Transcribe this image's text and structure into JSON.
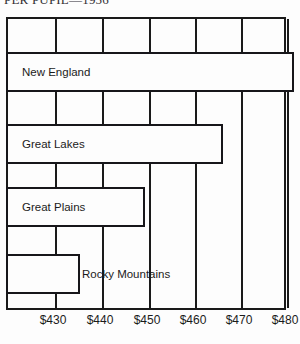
{
  "chart_data": {
    "type": "bar",
    "orientation": "horizontal",
    "title": "PER PUPIL—1956",
    "xlabel": "",
    "ylabel": "",
    "categories": [
      "New England",
      "Great Lakes",
      "Great Plains",
      "Rocky Mountains"
    ],
    "values": [
      480,
      465,
      448,
      434
    ],
    "value_labels": [
      "$480",
      "$465",
      "$448",
      "$434"
    ],
    "xlim": [
      420,
      480
    ],
    "xticks": [
      430,
      440,
      450,
      460,
      470,
      480
    ],
    "xtick_labels": [
      "$430",
      "$440",
      "$450",
      "$460",
      "$470",
      "$480"
    ],
    "grid": true,
    "grid_axis": "x",
    "legend": null,
    "bar_fill": "#fdfdfd",
    "bar_stroke": "#17161a",
    "frame_stroke": "#1a1a1a",
    "label_placement": [
      "inside",
      "inside",
      "inside",
      "outside"
    ],
    "series": [
      {
        "name": "Expenditure per pupil",
        "values": [
          480,
          465,
          448,
          434
        ]
      }
    ]
  },
  "bars": [
    {
      "label": "New England",
      "value": 480,
      "end_px": 286,
      "top_px": 33,
      "label_left_px": 14,
      "label_inside": true
    },
    {
      "label": "Great Lakes",
      "value": 465,
      "end_px": 215,
      "top_px": 105,
      "label_left_px": 14,
      "label_inside": true
    },
    {
      "label": "Great Plains",
      "value": 448,
      "end_px": 137,
      "top_px": 168,
      "label_left_px": 14,
      "label_inside": true
    },
    {
      "label": "Rocky Mountains",
      "value": 434,
      "end_px": 72,
      "top_px": 235,
      "label_left_px": 74,
      "label_inside": false
    }
  ],
  "gridlines": [
    {
      "label": "$430",
      "x_px": 47
    },
    {
      "label": "$440",
      "x_px": 94
    },
    {
      "label": "$450",
      "x_px": 141
    },
    {
      "label": "$460",
      "x_px": 187
    },
    {
      "label": "$470",
      "x_px": 233
    },
    {
      "label": "$480",
      "x_px": 279
    }
  ],
  "axis_labels": [
    {
      "text": "$430",
      "x_px": 53
    },
    {
      "text": "$440",
      "x_px": 100
    },
    {
      "text": "$450",
      "x_px": 147
    },
    {
      "text": "$460",
      "x_px": 193
    },
    {
      "text": "$470",
      "x_px": 239
    },
    {
      "text": "$480",
      "x_px": 285
    }
  ]
}
